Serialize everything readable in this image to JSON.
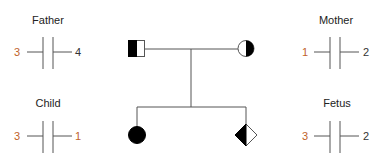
{
  "colors": {
    "highlight": "#c0622a",
    "normal": "#333333",
    "affected": "#000000",
    "line": "#555555"
  },
  "pedigree": {
    "father": {
      "symbol": "square",
      "fill": "left-half-filled"
    },
    "mother": {
      "symbol": "circle",
      "fill": "right-half-filled"
    },
    "child": {
      "symbol": "circle",
      "fill": "filled"
    },
    "fetus": {
      "symbol": "diamond",
      "fill": "left-half-filled"
    }
  },
  "genotypes": {
    "father": {
      "label": "Father",
      "left": "3",
      "right": "4",
      "left_highlight": true,
      "right_highlight": false
    },
    "mother": {
      "label": "Mother",
      "left": "1",
      "right": "2",
      "left_highlight": true,
      "right_highlight": false
    },
    "child": {
      "label": "Child",
      "left": "3",
      "right": "1",
      "left_highlight": true,
      "right_highlight": true
    },
    "fetus": {
      "label": "Fetus",
      "left": "3",
      "right": "2",
      "left_highlight": true,
      "right_highlight": false
    }
  }
}
